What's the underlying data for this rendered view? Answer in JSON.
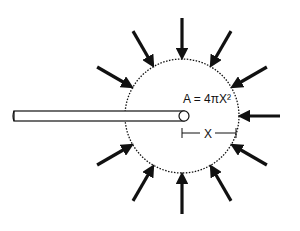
{
  "diagram": {
    "formula": "A = 4πX²",
    "radius_label": "X",
    "arrow_count": 12,
    "colors": {
      "ink": "#111111",
      "background": "#ffffff"
    },
    "elements": [
      "dotted-sphere-boundary",
      "rod",
      "inward-arrows",
      "radius-marker"
    ]
  }
}
